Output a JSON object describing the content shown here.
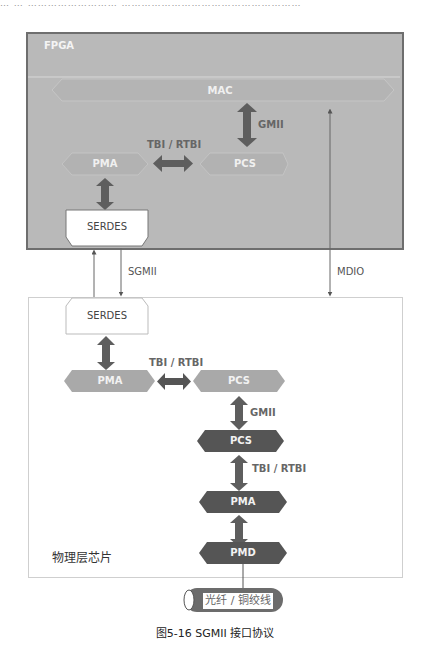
{
  "top_cut_text": "…    …        ………………………        ………………………………………………",
  "fpga": {
    "label": "FPGA",
    "blocks": {
      "mac": "MAC",
      "pma": "PMA",
      "pcs": "PCS",
      "serdes": "SERDES"
    },
    "interfaces": {
      "gmii": "GMII",
      "tbi_rtbi": "TBI / RTBI"
    }
  },
  "links": {
    "sgmii": "SGMII",
    "mdio": "MDIO"
  },
  "phy": {
    "label": "物理层芯片",
    "blocks": {
      "serdes": "SERDES",
      "pma_upper": "PMA",
      "pcs_upper": "PCS",
      "pcs_lower": "PCS",
      "pma_lower": "PMA",
      "pmd": "PMD"
    },
    "interfaces": {
      "tbi_rtbi_horizontal": "TBI / RTBI",
      "gmii": "GMII",
      "tbi_rtbi_vertical": "TBI / RTBI"
    }
  },
  "cable": {
    "label": "光纤 / 铜绞线"
  },
  "caption": "图5-16    SGMII 接口协议",
  "colors": {
    "fpga_fill": "#b9b9b9",
    "fpga_border": "#6e6e6e",
    "light_block": "#aaaaaa",
    "dark_block": "#555555",
    "arrow": "#666666",
    "phy_border": "#cfcfcf"
  }
}
